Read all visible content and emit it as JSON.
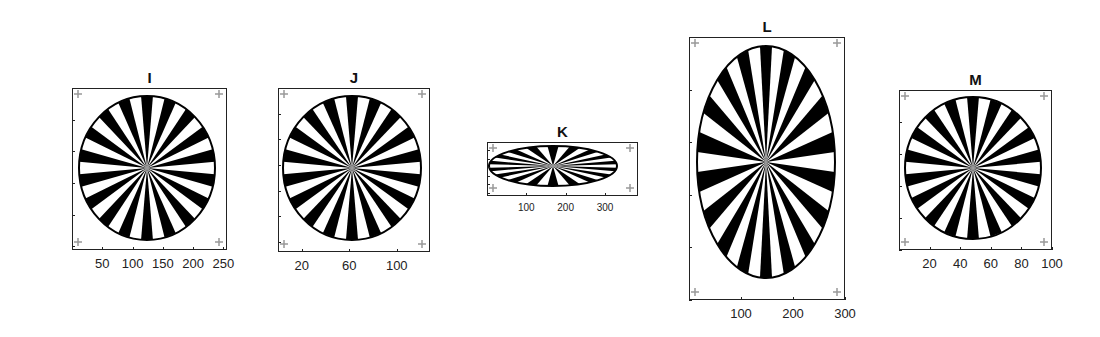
{
  "figure": {
    "background": "#ffffff",
    "foreground": "#000000"
  },
  "chart_data": [
    {
      "type": "heatmap",
      "title": "I",
      "description": "Siemens star test pattern image, circular",
      "spokes": 36,
      "xlabel": "",
      "ylabel": "",
      "xlim": [
        0,
        256
      ],
      "ylim": [
        256,
        0
      ],
      "xticks": [
        50,
        100,
        150,
        200,
        250
      ],
      "yticks": [
        50,
        100,
        150,
        200,
        250
      ],
      "box_px": {
        "left": 72,
        "top": 88,
        "width": 155,
        "height": 162
      },
      "shape": {
        "cx": 75,
        "cy": 80,
        "rx": 68,
        "ry": 72
      },
      "tick_label_size": "normal"
    },
    {
      "type": "heatmap",
      "title": "J",
      "description": "Siemens star test pattern image, circular, downsampled",
      "spokes": 36,
      "xlabel": "",
      "ylabel": "",
      "xlim": [
        0,
        128
      ],
      "ylim": [
        128,
        0
      ],
      "xticks": [
        20,
        60,
        100
      ],
      "yticks": [
        20,
        40,
        60,
        80,
        100,
        120
      ],
      "box_px": {
        "left": 278,
        "top": 88,
        "width": 152,
        "height": 164
      },
      "shape": {
        "cx": 74,
        "cy": 80,
        "rx": 69,
        "ry": 72
      },
      "tick_label_size": "normal"
    },
    {
      "type": "heatmap",
      "title": "K",
      "description": "Siemens star test pattern image, horizontally stretched ellipse",
      "spokes": 36,
      "xlabel": "",
      "ylabel": "",
      "xlim": [
        0,
        384
      ],
      "ylim": [
        128,
        0
      ],
      "xticks": [
        100,
        200,
        300
      ],
      "yticks": [
        20,
        40,
        60,
        80,
        100,
        120
      ],
      "box_px": {
        "left": 487,
        "top": 142,
        "width": 151,
        "height": 54
      },
      "shape": {
        "cx": 66,
        "cy": 24,
        "rx": 64,
        "ry": 20
      },
      "tick_label_size": "small"
    },
    {
      "type": "heatmap",
      "title": "L",
      "description": "Siemens star test pattern image, vertically stretched ellipse",
      "spokes": 36,
      "xlabel": "",
      "ylabel": "",
      "xlim": [
        0,
        300
      ],
      "ylim": [
        500,
        0
      ],
      "xticks": [
        100,
        200,
        300
      ],
      "yticks": [
        100,
        200,
        300,
        400,
        500
      ],
      "box_px": {
        "left": 689,
        "top": 37,
        "width": 156,
        "height": 263
      },
      "shape": {
        "cx": 77,
        "cy": 125,
        "rx": 69,
        "ry": 116
      },
      "tick_label_size": "normal"
    },
    {
      "type": "heatmap",
      "title": "M",
      "description": "Siemens star test pattern image, circular, 100x100",
      "spokes": 36,
      "xlabel": "",
      "ylabel": "",
      "xlim": [
        0,
        100
      ],
      "ylim": [
        100,
        0
      ],
      "xticks": [
        20,
        40,
        60,
        80,
        100
      ],
      "yticks": [
        20,
        40,
        60,
        80,
        100
      ],
      "box_px": {
        "left": 899,
        "top": 90,
        "width": 153,
        "height": 160
      },
      "shape": {
        "cx": 74,
        "cy": 78,
        "rx": 68,
        "ry": 71
      },
      "tick_label_size": "normal"
    }
  ]
}
